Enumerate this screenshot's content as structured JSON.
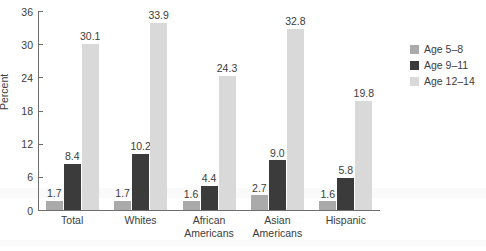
{
  "chart_data": {
    "type": "bar",
    "title": "",
    "xlabel": "",
    "ylabel": "Percent",
    "ylim": [
      0,
      36
    ],
    "yticks": [
      0,
      6,
      12,
      18,
      24,
      30,
      36
    ],
    "grid": false,
    "legend_position": "right",
    "categories": [
      "Total",
      "Whites",
      "African\nAmericans",
      "Asian\nAmericans",
      "Hispanic"
    ],
    "series": [
      {
        "name": "Age 5–8",
        "color": "#aaaaaa",
        "values": [
          1.7,
          1.7,
          1.6,
          2.7,
          1.6
        ]
      },
      {
        "name": "Age 9–11",
        "color": "#3b3b3b",
        "values": [
          8.4,
          10.2,
          4.4,
          9.0,
          5.8
        ]
      },
      {
        "name": "Age 12–14",
        "color": "#d9d9d9",
        "values": [
          30.1,
          33.9,
          24.3,
          32.8,
          19.8
        ]
      }
    ],
    "value_labels": [
      [
        "1.7",
        "8.4",
        "30.1"
      ],
      [
        "1.7",
        "10.2",
        "33.9"
      ],
      [
        "1.6",
        "4.4",
        "24.3"
      ],
      [
        "2.7",
        "9.0",
        "32.8"
      ],
      [
        "1.6",
        "5.8",
        "19.8"
      ]
    ]
  },
  "legend": {
    "items": [
      {
        "label": "Age 5–8"
      },
      {
        "label": "Age 9–11"
      },
      {
        "label": "Age 12–14"
      }
    ]
  },
  "axis": {
    "y_title": "Percent",
    "y_tick_labels": [
      "36",
      "30",
      "24",
      "18",
      "12",
      "6",
      "0"
    ]
  }
}
